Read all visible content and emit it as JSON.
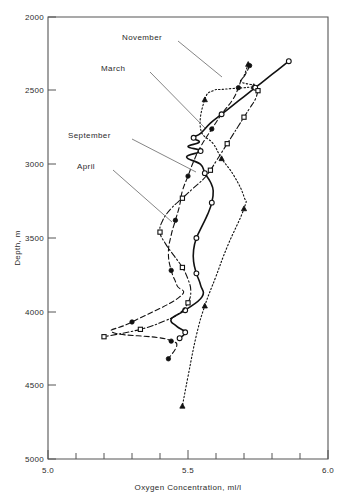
{
  "chart_data": {
    "type": "line",
    "title": "",
    "xlabel": "Oxygen Concentration,  ml/l",
    "ylabel": "Depth, m",
    "xlim": [
      5.0,
      6.0
    ],
    "ylim": [
      2000,
      5000
    ],
    "y_inverted": true,
    "grid": false,
    "legend_position": "inline-annotations",
    "x_tick_labels": [
      "5.0",
      "5.5",
      "6.0"
    ],
    "x_tick_values": [
      5.0,
      5.5,
      6.0
    ],
    "x_minor_step": 0.1,
    "y_tick_labels": [
      "2000",
      "2500",
      "3000",
      "3500",
      "4000",
      "4500",
      "5000"
    ],
    "y_tick_values": [
      2000,
      2500,
      3000,
      3500,
      4000,
      4500,
      5000
    ],
    "series": [
      {
        "name": "November",
        "line_style": "dotted",
        "marker": "filled-triangle",
        "x": [
          5.715,
          5.7,
          5.69,
          5.735,
          5.63,
          5.59,
          5.56,
          5.545,
          5.59,
          5.62,
          5.665,
          5.7,
          5.7,
          5.64,
          5.6,
          5.56,
          5.53,
          5.5,
          5.48
        ],
        "y": [
          2320,
          2400,
          2440,
          2470,
          2490,
          2500,
          2560,
          2760,
          2860,
          2960,
          3080,
          3220,
          3300,
          3560,
          3760,
          3960,
          4160,
          4440,
          4640
        ]
      },
      {
        "name": "March",
        "line_style": "dashed",
        "marker": "filled-circle",
        "x": [
          5.72,
          5.705,
          5.69,
          5.68,
          5.66,
          5.62,
          5.585,
          5.545,
          5.52,
          5.5,
          5.48,
          5.47,
          5.455,
          5.44,
          5.43,
          5.44,
          5.46,
          5.47,
          5.3,
          5.23,
          5.39,
          5.44,
          5.46,
          5.43
        ],
        "y": [
          2330,
          2390,
          2430,
          2480,
          2560,
          2660,
          2760,
          2880,
          2980,
          3080,
          3180,
          3280,
          3380,
          3480,
          3600,
          3720,
          3820,
          3900,
          4070,
          4140,
          4175,
          4200,
          4230,
          4320
        ]
      },
      {
        "name": "September",
        "line_style": "solid",
        "marker": "open-circle",
        "x": [
          5.86,
          5.82,
          5.78,
          5.74,
          5.7,
          5.66,
          5.62,
          5.58,
          5.545,
          5.52,
          5.54,
          5.5,
          5.545,
          5.495,
          5.545,
          5.56,
          5.58,
          5.59,
          5.585,
          5.57,
          5.55,
          5.53,
          5.52,
          5.52,
          5.53,
          5.545,
          5.55,
          5.49,
          5.44,
          5.46,
          5.49,
          5.47
        ],
        "y": [
          2300,
          2360,
          2420,
          2480,
          2540,
          2600,
          2660,
          2720,
          2790,
          2820,
          2850,
          2880,
          2910,
          2950,
          3000,
          3060,
          3120,
          3180,
          3260,
          3340,
          3420,
          3500,
          3580,
          3660,
          3740,
          3820,
          3900,
          3990,
          4050,
          4100,
          4140,
          4180
        ]
      },
      {
        "name": "April",
        "line_style": "dash-dot",
        "marker": "open-square",
        "x": [
          5.75,
          5.74,
          5.72,
          5.7,
          5.68,
          5.66,
          5.64,
          5.62,
          5.6,
          5.58,
          5.555,
          5.52,
          5.48,
          5.44,
          5.41,
          5.4,
          5.42,
          5.45,
          5.48,
          5.5,
          5.51,
          5.5,
          5.47,
          5.42,
          5.33,
          5.2
        ],
        "y": [
          2500,
          2560,
          2620,
          2680,
          2740,
          2800,
          2860,
          2920,
          2980,
          3040,
          3100,
          3160,
          3230,
          3300,
          3380,
          3460,
          3540,
          3620,
          3700,
          3780,
          3860,
          3940,
          4010,
          4060,
          4120,
          4170
        ]
      }
    ],
    "annotations": [
      {
        "text": "November",
        "points_to_series": "November"
      },
      {
        "text": "March",
        "points_to_series": "March"
      },
      {
        "text": "September",
        "points_to_series": "September"
      },
      {
        "text": "April",
        "points_to_series": "April"
      }
    ]
  }
}
